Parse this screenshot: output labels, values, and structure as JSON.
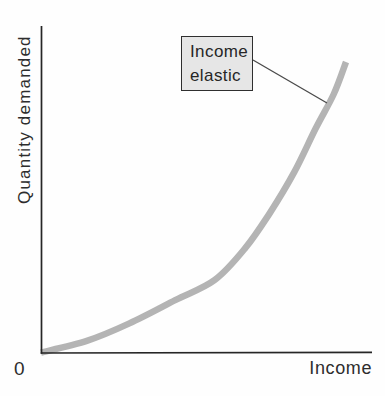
{
  "figure": {
    "y_axis_label": "Quantity demanded",
    "x_axis_label": "Income",
    "origin_label": "0",
    "annotation_lines": [
      "Income",
      "elastic"
    ],
    "annotation_text": "Income elastic"
  },
  "colors": {
    "curve": "#b4b4b4",
    "axis": "#262626",
    "leader_line": "#4a4a4a",
    "callout_fill": "#e6e6e6",
    "callout_border": "#2f2f2f"
  },
  "chart_data": {
    "type": "line",
    "title": "",
    "xlabel": "Income",
    "ylabel": "Quantity demanded",
    "xlim": [
      0,
      100
    ],
    "ylim": [
      0,
      100
    ],
    "grid": false,
    "legend": "none",
    "axes_numeric_labels": false,
    "series": [
      {
        "name": "Income elastic demand curve",
        "shape": "convex increasing (quantity demanded rises at an increasing rate as income rises)",
        "x": [
          0,
          15,
          29,
          44,
          57,
          67,
          75,
          83,
          90,
          96,
          100
        ],
        "y": [
          0,
          4,
          10,
          18,
          25,
          36,
          48,
          62,
          77,
          89,
          100
        ]
      }
    ],
    "annotations": [
      {
        "text": "Income elastic",
        "style": "boxed label with leader line pointing to upper portion of curve"
      }
    ]
  }
}
